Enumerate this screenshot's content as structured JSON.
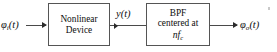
{
  "diagram": {
    "type": "block-diagram",
    "background_color": "#ffffff",
    "line_color": "#4a4a4a",
    "text_color": "#0d0d0d",
    "input_signal": {
      "symbol": "φ",
      "subscript": "i",
      "argument": "(t)",
      "full": "φi(t)"
    },
    "intermediate_signal": {
      "symbol": "y",
      "argument": "(t)",
      "full": "y(t)"
    },
    "output_signal": {
      "symbol": "φ",
      "subscript": "o",
      "argument": "(t)",
      "full": "φo(t)"
    },
    "blocks": [
      {
        "id": "nonlinear-device",
        "line1": "Nonlinear",
        "line2": "Device"
      },
      {
        "id": "bandpass-filter",
        "line1": "BPF",
        "line2": "centered at",
        "line3_symbol": "nf",
        "line3_subscript": "c",
        "line3_full": "nfc"
      }
    ]
  }
}
